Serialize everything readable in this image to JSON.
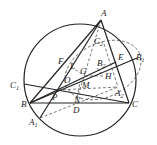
{
  "figure": {
    "type": "geometry-diagram",
    "points": [
      {
        "id": "A",
        "label": "A",
        "sub": "",
        "x": 101,
        "y": 20,
        "lx": 101,
        "ly": 16
      },
      {
        "id": "B",
        "label": "B",
        "sub": "",
        "x": 30,
        "y": 103,
        "lx": 21,
        "ly": 107
      },
      {
        "id": "C",
        "label": "C",
        "sub": "",
        "x": 129,
        "y": 103,
        "lx": 132,
        "ly": 107
      },
      {
        "id": "D",
        "label": "D",
        "sub": "",
        "x": 76,
        "y": 103,
        "lx": 73,
        "ly": 113
      },
      {
        "id": "E",
        "label": "E",
        "sub": "",
        "x": 116,
        "y": 62,
        "lx": 118,
        "ly": 60
      },
      {
        "id": "F",
        "label": "F",
        "sub": "",
        "x": 67,
        "y": 62,
        "lx": 58,
        "ly": 64
      },
      {
        "id": "G",
        "label": "G",
        "sub": "",
        "x": 85,
        "y": 76,
        "lx": 80,
        "ly": 74
      },
      {
        "id": "H",
        "label": "H",
        "sub": "",
        "x": 103,
        "y": 76,
        "lx": 105,
        "ly": 79
      },
      {
        "id": "O",
        "label": "O",
        "sub": "",
        "x": 80,
        "y": 80,
        "lx": 64,
        "ly": 83
      },
      {
        "id": "M",
        "label": "M",
        "sub": "",
        "x": 80,
        "y": 83,
        "lx": 82,
        "ly": 88
      },
      {
        "id": "N",
        "label": "N",
        "sub": "",
        "x": 77,
        "y": 97,
        "lx": 74,
        "ly": 103
      },
      {
        "id": "P",
        "label": "P",
        "sub": "",
        "x": 58,
        "y": 90,
        "lx": 52,
        "ly": 100
      },
      {
        "id": "L",
        "label": "L",
        "sub": "",
        "x": 71,
        "y": 67,
        "lx": 70,
        "ly": 69
      },
      {
        "id": "A1",
        "label": "A",
        "sub": "1",
        "x": 40,
        "y": 118,
        "lx": 29,
        "ly": 125
      },
      {
        "id": "B1",
        "label": "B",
        "sub": "1",
        "x": 137,
        "y": 58,
        "lx": 136,
        "ly": 60
      },
      {
        "id": "C1",
        "label": "C",
        "sub": "1",
        "x": 24,
        "y": 84,
        "lx": 10,
        "ly": 88
      },
      {
        "id": "A2",
        "label": "A",
        "sub": "2",
        "x": 118,
        "y": 87,
        "lx": 115,
        "ly": 96
      },
      {
        "id": "B2",
        "label": "B",
        "sub": "2",
        "x": 97,
        "y": 68,
        "lx": 97,
        "ly": 66
      },
      {
        "id": "C2",
        "label": "C",
        "sub": "2",
        "x": 104,
        "y": 44,
        "lx": 94,
        "ly": 44
      }
    ],
    "circle": {
      "cx": 80,
      "cy": 80,
      "r": 56
    },
    "dashed_circle": {
      "cx": 103,
      "cy": 70,
      "rx": 40,
      "ry": 27
    }
  }
}
